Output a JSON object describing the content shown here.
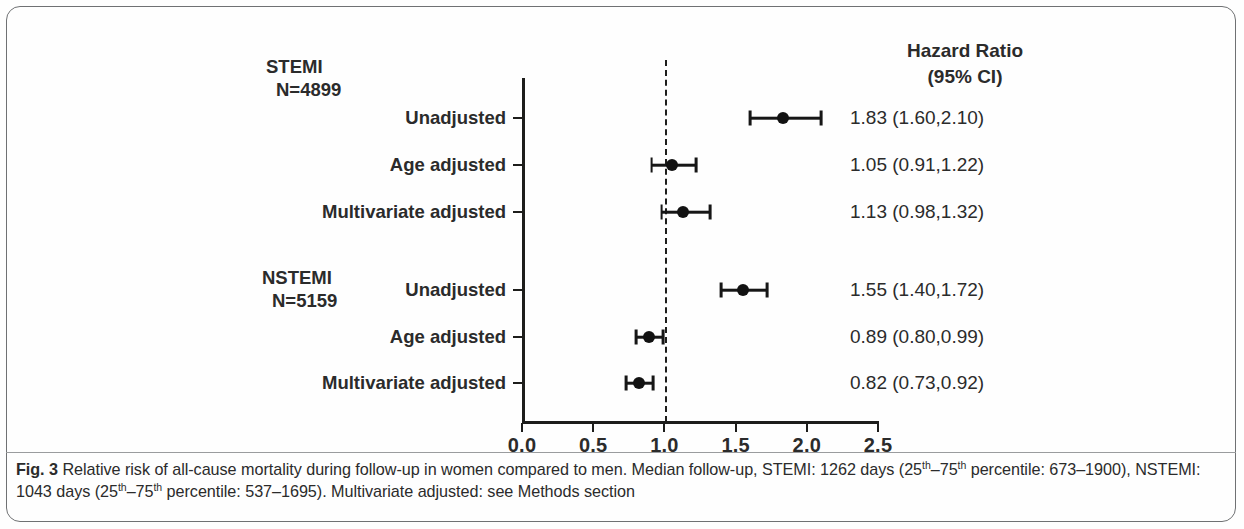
{
  "figure": {
    "number": "Fig. 3",
    "caption_parts": {
      "lead": "Relative risk of all-cause mortality during follow-up in women compared to men. Median follow-up, STEMI: 1262 days (25",
      "sup1": "th",
      "mid1": "–75",
      "sup2": "th",
      "mid2": " percentile: 673–1900), NSTEMI: 1043 days (25",
      "sup3": "th",
      "mid3": "–75",
      "sup4": "th",
      "tail": " percentile: 537–1695). Multivariate adjusted: see Methods section"
    }
  },
  "header": {
    "hr_title": "Hazard Ratio",
    "hr_subtitle": "(95% CI)"
  },
  "groups": [
    {
      "name": "STEMI",
      "n_label": "N=4899"
    },
    {
      "name": "NSTEMI",
      "n_label": "N=5159"
    }
  ],
  "chart_data": {
    "type": "scatter",
    "plot_style": "forest",
    "title": "",
    "xlabel": "",
    "ylabel": "",
    "xlim": [
      0.0,
      2.5
    ],
    "xticks": [
      0.0,
      0.5,
      1.0,
      1.5,
      2.0,
      2.5
    ],
    "xtick_labels": [
      "0.0",
      "0.5",
      "1.0",
      "1.5",
      "2.0",
      "2.5"
    ],
    "reference_line": 1.0,
    "reference_line_style": "dashed",
    "grid": false,
    "legend": "none",
    "value_column_header": "Hazard Ratio (95% CI)",
    "groups": [
      {
        "group": "STEMI",
        "n": 4899,
        "rows": [
          {
            "label": "Unadjusted",
            "estimate": 1.83,
            "ci_low": 1.6,
            "ci_high": 2.1,
            "value_text": "1.83 (1.60,2.10)"
          },
          {
            "label": "Age adjusted",
            "estimate": 1.05,
            "ci_low": 0.91,
            "ci_high": 1.22,
            "value_text": "1.05 (0.91,1.22)"
          },
          {
            "label": "Multivariate adjusted",
            "estimate": 1.13,
            "ci_low": 0.98,
            "ci_high": 1.32,
            "value_text": "1.13 (0.98,1.32)"
          }
        ]
      },
      {
        "group": "NSTEMI",
        "n": 5159,
        "rows": [
          {
            "label": "Unadjusted",
            "estimate": 1.55,
            "ci_low": 1.4,
            "ci_high": 1.72,
            "value_text": "1.55 (1.40,1.72)"
          },
          {
            "label": "Age adjusted",
            "estimate": 0.89,
            "ci_low": 0.8,
            "ci_high": 0.99,
            "value_text": "0.89 (0.80,0.99)"
          },
          {
            "label": "Multivariate adjusted",
            "estimate": 0.82,
            "ci_low": 0.73,
            "ci_high": 0.92,
            "value_text": "0.82 (0.73,0.92)"
          }
        ]
      }
    ]
  }
}
